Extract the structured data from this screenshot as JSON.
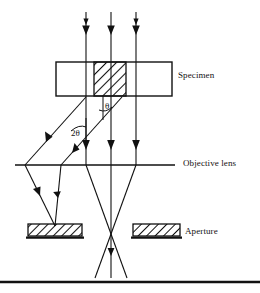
{
  "figure": {
    "background_color": "#ffffff",
    "stroke_color": "#111111",
    "width": 260,
    "height": 293
  },
  "labels": {
    "specimen": "Specimen",
    "objective_lens": "Objective lens",
    "aperture": "Aperture",
    "angle_theta": "θ",
    "angle_two_theta": "2θ"
  },
  "components": {
    "specimen_box": {
      "name": "Specimen",
      "x": 56,
      "y": 62,
      "width": 116,
      "height": 34,
      "hatched_region": {
        "x": 94,
        "y": 62,
        "width": 32,
        "height": 34
      }
    },
    "objective_lens": {
      "name": "Objective lens",
      "y": 165,
      "x_start": 15,
      "x_end": 175
    },
    "apertures": [
      {
        "name": "left aperture stop",
        "x": 28,
        "y": 224,
        "width": 54,
        "height": 12
      },
      {
        "name": "right aperture stop",
        "x": 133,
        "y": 224,
        "width": 47,
        "height": 12
      }
    ],
    "incident_rays": [
      {
        "x": 86,
        "y_start": 12,
        "y_end": 62
      },
      {
        "x": 111,
        "y_start": 12,
        "y_end": 62
      },
      {
        "x": 136,
        "y_start": 12,
        "y_end": 62
      }
    ],
    "transmitted_rays": [
      {
        "x": 86,
        "y_start": 96,
        "y_end": 165
      },
      {
        "x": 111,
        "y_start": 96,
        "y_end": 165
      },
      {
        "x": 136,
        "y_start": 96,
        "y_end": 165
      }
    ],
    "crossover_point": {
      "x": 111,
      "y": 234
    },
    "bottom_rule": {
      "y": 282,
      "x_start": 0,
      "x_end": 260
    }
  }
}
